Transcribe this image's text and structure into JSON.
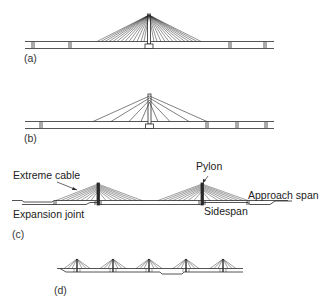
{
  "figure": {
    "panels": [
      {
        "id": "a",
        "label": "(a)",
        "description": "Single pylon, fan cable arrangement, dense cables"
      },
      {
        "id": "b",
        "label": "(b)",
        "description": "Single pylon, sparse fan cables"
      },
      {
        "id": "c",
        "label": "(c)",
        "description": "Two-pylon cable-stayed bridge with labeled components",
        "annotations": {
          "extreme_cable": "Extreme cable",
          "pylon": "Pylon",
          "approach_span": "Approach span",
          "expansion_joint": "Expansion joint",
          "sidespan": "Sidespan"
        }
      },
      {
        "id": "d",
        "label": "(d)",
        "description": "Multi-span cable-stayed bridge with five pylons"
      }
    ]
  },
  "colors": {
    "line": "#2a2a2a",
    "background": "#ffffff"
  }
}
